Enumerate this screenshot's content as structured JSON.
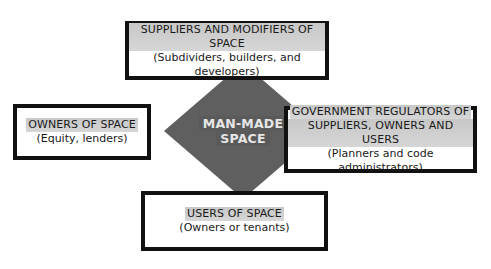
{
  "diagram": {
    "center": {
      "line1": "MAN-MADE",
      "line2": "SPACE",
      "fill_color": "#5f5f5f",
      "text_color": "#e6e6e6"
    },
    "boxes": {
      "suppliers": {
        "title": "SUPPLIERS AND MODIFIERS OF SPACE",
        "subtitle": "(Subdividers, builders, and developers)"
      },
      "owners": {
        "title": "OWNERS OF SPACE",
        "subtitle": "(Equity, lenders)"
      },
      "government": {
        "title_line1": "GOVERNMENT REGULATORS OF",
        "title_line2": "SUPPLIERS, OWNERS AND USERS",
        "subtitle": "(Planners and code administrators)"
      },
      "users": {
        "title": "USERS OF SPACE",
        "subtitle": "(Owners or tenants)"
      }
    },
    "colors": {
      "border": "#111111",
      "title_highlight": "#cfcfcf",
      "background": "#ffffff"
    }
  }
}
